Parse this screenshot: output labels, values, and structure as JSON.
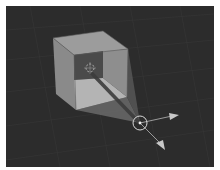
{
  "viewport": {
    "type": "3d-viewport",
    "background": "#2c2c2c",
    "grid_color": "#363636"
  },
  "scene": {
    "object": "cube",
    "colors": {
      "top_face": "#9a9a9a",
      "left_face": "#8a8a8a",
      "inner_back": "#4a4a4a",
      "inner_right": "#8c8c8c",
      "inner_floor": "#b2b2b2",
      "cone": "#6a6a6a",
      "beam": "#3a3a3a"
    }
  },
  "gizmo": {
    "type": "transform-gizmo",
    "circle_color": "#d8d8d8",
    "arrow_color": "#bfbfbf"
  }
}
